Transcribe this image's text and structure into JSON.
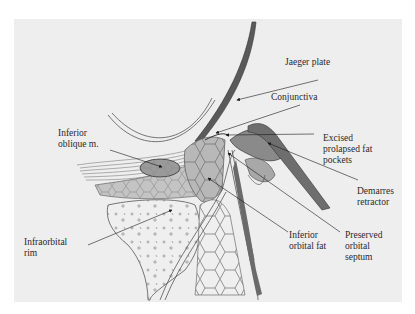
{
  "figure": {
    "type": "anatomical cross-section illustration",
    "labels": {
      "jaeger_plate": "Jaeger plate",
      "conjunctiva": "Conjunctiva",
      "inferior_oblique": "Inferior\noblique m.",
      "excised_fat": "Excised\nprolapsed fat\npockets",
      "demarres_retractor": "Demarres\nretractor",
      "infraorbital_rim": "Infraorbital\nrim",
      "inferior_orbital_fat": "Inferior\norbital fat",
      "preserved_septum": "Preserved\norbital\nseptum"
    },
    "colors": {
      "background": "#eeeeee",
      "ink": "#2a2a2a",
      "tissue_shade": "#b8b8b8",
      "instrument": "#5a5a5a"
    }
  }
}
